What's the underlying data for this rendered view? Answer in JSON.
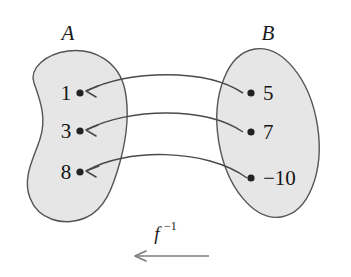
{
  "figure": {
    "kind": "inverse-function-mapping-diagram",
    "sets": {
      "domain": {
        "label": "A",
        "elements": [
          "1",
          "3",
          "8"
        ]
      },
      "codomain": {
        "label": "B",
        "elements": [
          "5",
          "7",
          "−10"
        ]
      }
    },
    "function": {
      "label_base": "f",
      "label_exponent": "−1",
      "direction": "right-to-left"
    },
    "mappings": [
      {
        "from": "5",
        "to": "1"
      },
      {
        "from": "7",
        "to": "3"
      },
      {
        "from": "−10",
        "to": "8"
      }
    ],
    "colors": {
      "blob_fill": "#e6e6e6",
      "blob_stroke": "#555555",
      "arrow_stroke": "#4a4a4a",
      "axis_arrow_stroke": "#7d7d7d",
      "text": "#141414",
      "background": "#ffffff"
    }
  }
}
